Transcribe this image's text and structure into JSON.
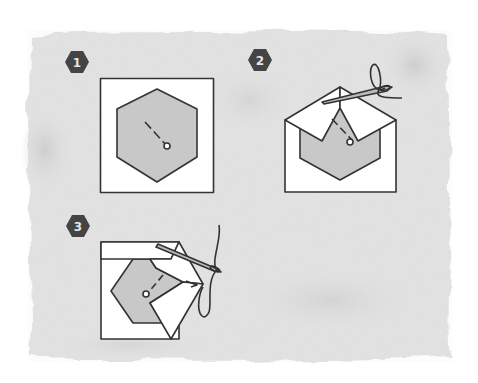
{
  "diagram": {
    "colors": {
      "background": "#ffffff",
      "watercolor": "#dcdcdc",
      "watercolor_light": "#e8e8e8",
      "fabric": "#ffffff",
      "paper_template": "#c8c8c8",
      "outline": "#333333",
      "badge": "#444444",
      "badge_text": "#e6e6e6"
    },
    "steps": [
      {
        "number": "1",
        "description": "Hexagon paper template centered on square fabric"
      },
      {
        "number": "2",
        "description": "Top corners folded over template and stitched"
      },
      {
        "number": "3",
        "description": "Sides folded around hexagon and stitched"
      }
    ]
  }
}
